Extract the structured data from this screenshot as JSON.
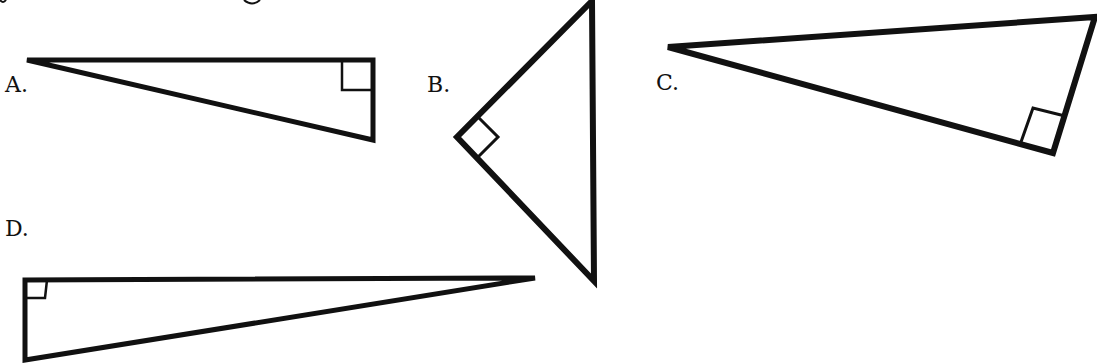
{
  "figure": {
    "stroke_color": "#111111",
    "background": "#ffffff",
    "triangles": [
      {
        "label": "A.",
        "label_pos": [
          5,
          74
        ],
        "vertices": [
          [
            27,
            60
          ],
          [
            373,
            60
          ],
          [
            373,
            140
          ]
        ],
        "right_angle_vertex": [
          373,
          60
        ],
        "right_angle_marker": "342,60 342,90 373,90"
      },
      {
        "label": "B.",
        "label_pos": [
          427,
          74
        ],
        "vertices": [
          [
            592,
            1
          ],
          [
            457,
            137
          ],
          [
            594,
            281
          ]
        ],
        "right_angle_vertex": [
          457,
          137
        ],
        "right_angle_marker": "478,117 498,137 478,157"
      },
      {
        "label": "C.",
        "label_pos": [
          656,
          72
        ],
        "vertices": [
          [
            668,
            47
          ],
          [
            1095,
            17
          ],
          [
            1053,
            153
          ]
        ],
        "right_angle_vertex": [
          1053,
          153
        ],
        "right_angle_marker": "1021,142 1033,108 1065,116"
      },
      {
        "label": "D.",
        "label_pos": [
          5,
          218
        ],
        "vertices": [
          [
            25,
            280
          ],
          [
            535,
            278
          ],
          [
            25,
            360
          ]
        ],
        "right_angle_vertex": [
          25,
          280
        ],
        "right_angle_marker": "25,298 45,298 47,280"
      }
    ]
  }
}
